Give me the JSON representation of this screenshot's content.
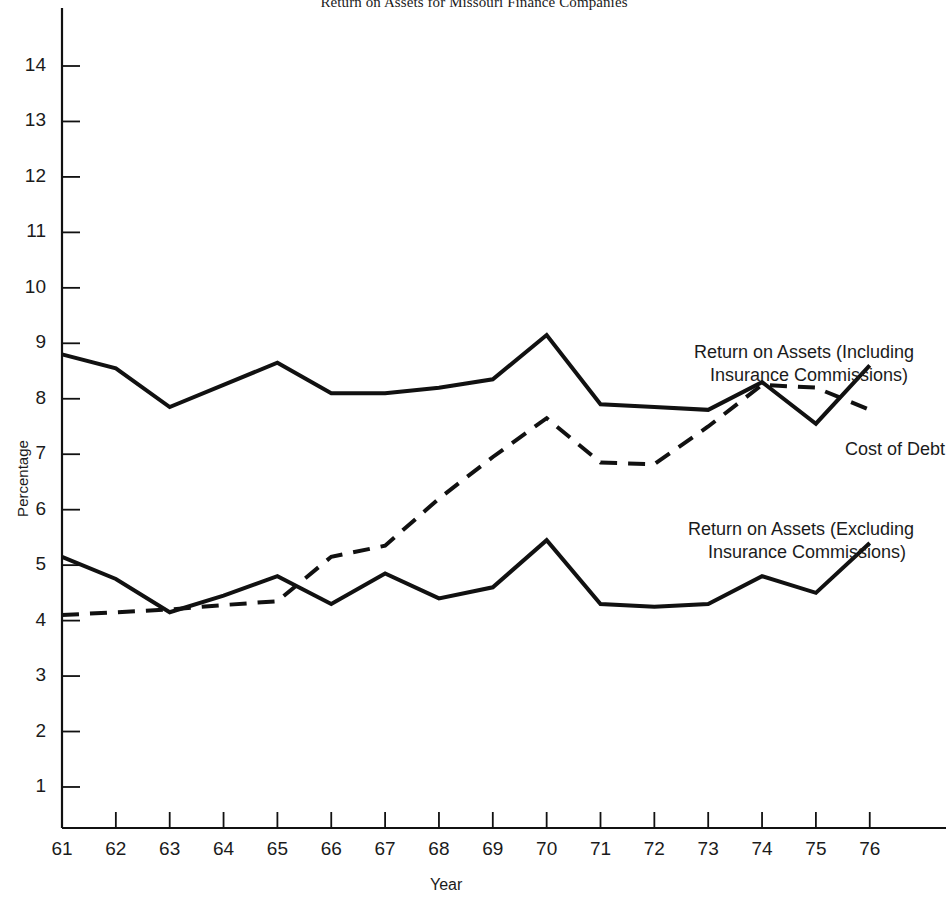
{
  "chart_data": {
    "type": "line",
    "title": "Return on Assets for Missouri Finance Companies",
    "xlabel": "Year",
    "ylabel": "Percentage",
    "grid": false,
    "legend_position": "inline-annotations",
    "x": [
      61,
      62,
      63,
      64,
      65,
      66,
      67,
      68,
      69,
      70,
      71,
      72,
      73,
      74,
      75,
      76
    ],
    "xtick_labels": [
      "61",
      "62",
      "63",
      "64",
      "65",
      "66",
      "67",
      "68",
      "69",
      "70",
      "71",
      "72",
      "73",
      "74",
      "75",
      "76"
    ],
    "ytick_labels": [
      "1",
      "2",
      "3",
      "4",
      "5",
      "6",
      "7",
      "8",
      "9",
      "10",
      "11",
      "12",
      "13",
      "14"
    ],
    "ylim": [
      0,
      14.8
    ],
    "xlim": [
      60.6,
      76.6
    ],
    "series": [
      {
        "name": "Return on Assets (Including Insurance Commissions)",
        "style": "solid",
        "color": "#111111",
        "values": [
          8.8,
          8.55,
          7.85,
          8.25,
          8.65,
          8.1,
          8.1,
          8.2,
          8.35,
          9.15,
          7.9,
          7.85,
          7.8,
          8.3,
          7.55,
          8.6
        ]
      },
      {
        "name": "Return on Assets (Excluding Insurance Commissions)",
        "style": "solid",
        "color": "#111111",
        "values": [
          5.15,
          4.75,
          4.15,
          4.45,
          4.8,
          4.3,
          4.85,
          4.4,
          4.6,
          5.45,
          4.3,
          4.25,
          4.3,
          4.8,
          4.5,
          5.4
        ]
      },
      {
        "name": "Cost of Debt",
        "style": "dashed",
        "color": "#111111",
        "values": [
          4.1,
          4.15,
          4.2,
          4.28,
          4.35,
          5.15,
          5.35,
          6.2,
          6.95,
          7.65,
          6.85,
          6.82,
          7.5,
          8.25,
          8.2,
          7.8
        ]
      }
    ],
    "annotations": [
      {
        "id": "including",
        "line1": "Return on Assets (Including",
        "line2": "Insurance Commissions)"
      },
      {
        "id": "excluding",
        "line1": "Return on Assets (Excluding",
        "line2": "Insurance Commissions)"
      },
      {
        "id": "cost-of-debt",
        "line1": "Cost of Debt"
      }
    ]
  }
}
